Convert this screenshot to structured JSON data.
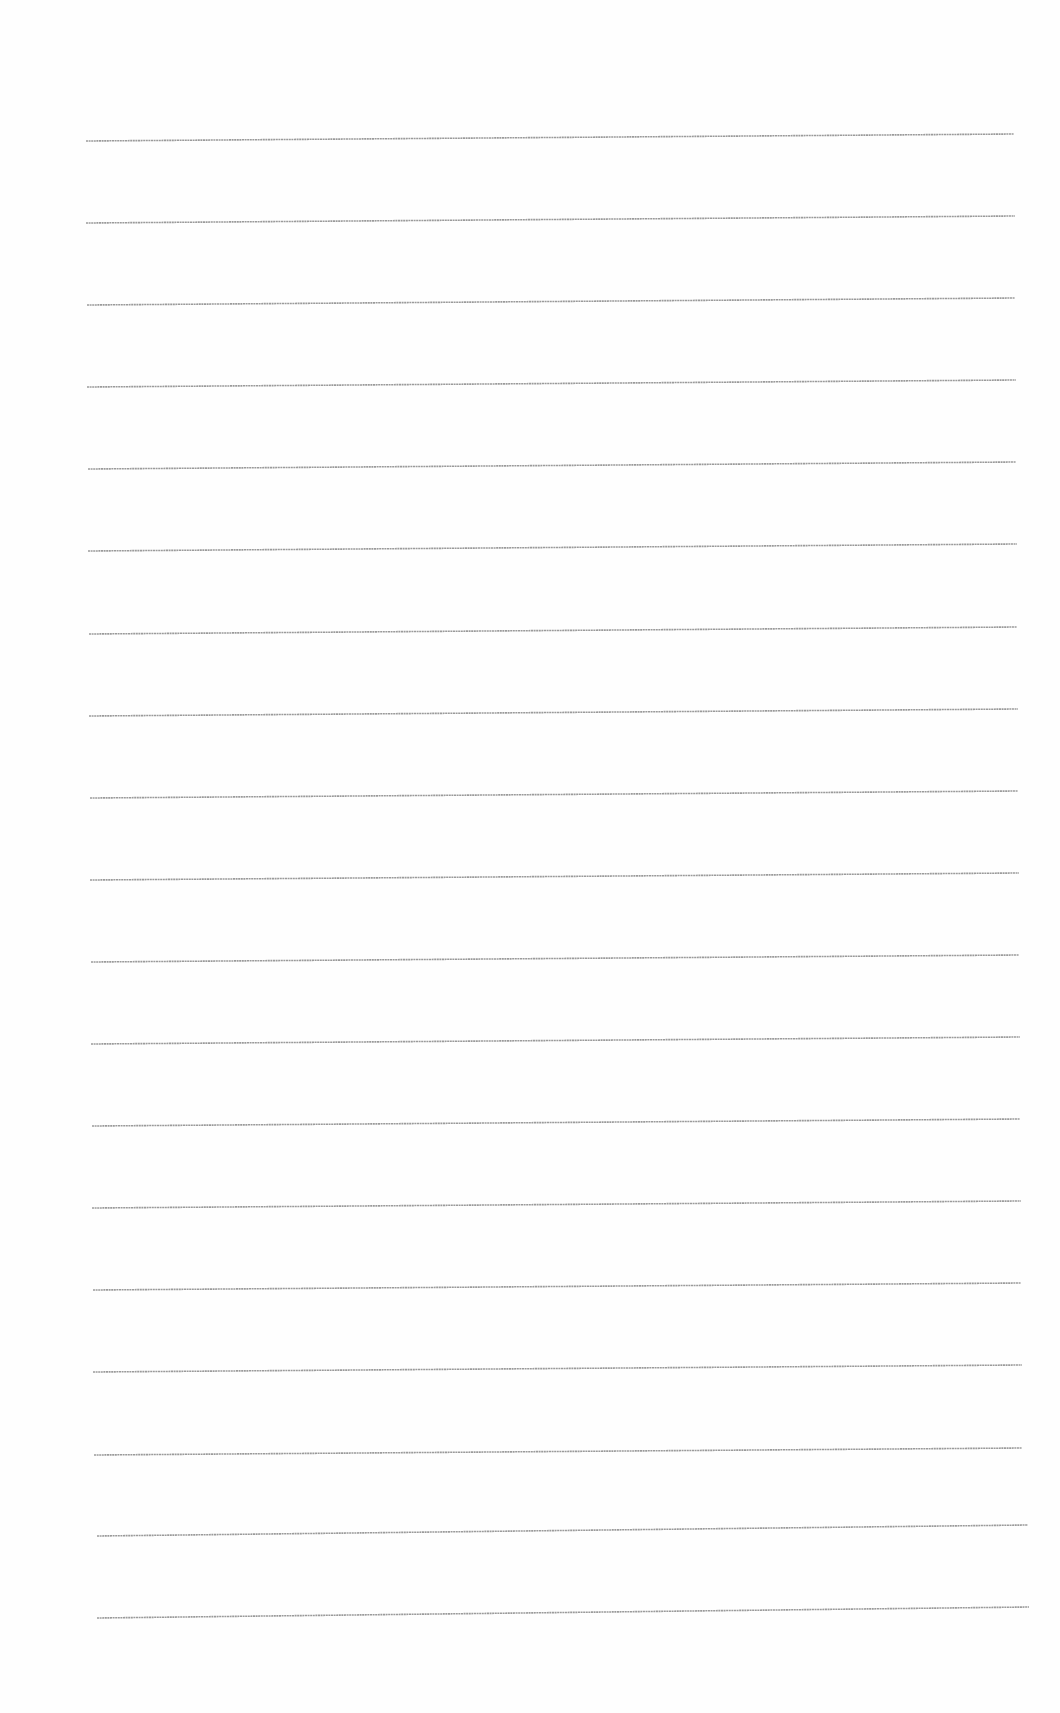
{
  "page": {
    "type": "ruled-sheet",
    "background": "#fefefe",
    "line_color": "#9a9a9a",
    "line_count": 19,
    "lines": [
      {
        "x1": 86,
        "y1": 141,
        "x2": 1014,
        "y2": 134
      },
      {
        "x1": 86,
        "y1": 223,
        "x2": 1015,
        "y2": 216
      },
      {
        "x1": 87,
        "y1": 305,
        "x2": 1015,
        "y2": 298
      },
      {
        "x1": 87,
        "y1": 387,
        "x2": 1016,
        "y2": 380
      },
      {
        "x1": 88,
        "y1": 469,
        "x2": 1016,
        "y2": 462
      },
      {
        "x1": 88,
        "y1": 551,
        "x2": 1017,
        "y2": 544
      },
      {
        "x1": 89,
        "y1": 634,
        "x2": 1017,
        "y2": 627
      },
      {
        "x1": 89,
        "y1": 716,
        "x2": 1018,
        "y2": 709
      },
      {
        "x1": 90,
        "y1": 798,
        "x2": 1018,
        "y2": 791
      },
      {
        "x1": 90,
        "y1": 880,
        "x2": 1019,
        "y2": 873
      },
      {
        "x1": 91,
        "y1": 962,
        "x2": 1019,
        "y2": 955
      },
      {
        "x1": 91,
        "y1": 1044,
        "x2": 1020,
        "y2": 1037
      },
      {
        "x1": 92,
        "y1": 1126,
        "x2": 1020,
        "y2": 1119
      },
      {
        "x1": 92,
        "y1": 1208,
        "x2": 1021,
        "y2": 1201
      },
      {
        "x1": 93,
        "y1": 1290,
        "x2": 1021,
        "y2": 1283
      },
      {
        "x1": 93,
        "y1": 1372,
        "x2": 1022,
        "y2": 1365
      },
      {
        "x1": 94,
        "y1": 1455,
        "x2": 1022,
        "y2": 1448
      },
      {
        "x1": 97,
        "y1": 1536,
        "x2": 1028,
        "y2": 1525
      },
      {
        "x1": 97,
        "y1": 1618,
        "x2": 1029,
        "y2": 1607
      }
    ]
  }
}
